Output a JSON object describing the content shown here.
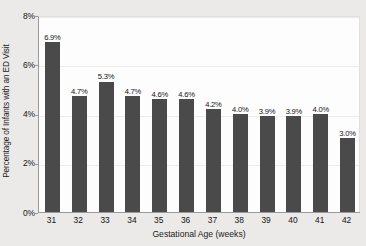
{
  "chart_data": {
    "type": "bar",
    "title": "",
    "xlabel": "Gestational Age (weeks)",
    "ylabel": "Percentage of Infants with an ED Visit",
    "categories": [
      "31",
      "32",
      "33",
      "34",
      "35",
      "36",
      "37",
      "38",
      "39",
      "40",
      "41",
      "42"
    ],
    "values": [
      6.9,
      4.7,
      5.3,
      4.7,
      4.6,
      4.6,
      4.2,
      4.0,
      3.9,
      3.9,
      4.0,
      3.0
    ],
    "data_labels": [
      "6.9%",
      "4.7%",
      "5.3%",
      "4.7%",
      "4.6%",
      "4.6%",
      "4.2%",
      "4.0%",
      "3.9%",
      "3.9%",
      "4.0%",
      "3.0%"
    ],
    "ylim": [
      0,
      8
    ],
    "ytick_values": [
      0,
      2,
      4,
      6,
      8
    ],
    "ytick_labels": [
      "0%",
      "2%",
      "4%",
      "6%",
      "8%"
    ],
    "grid": true,
    "grid_axis": "y",
    "legend": false,
    "bar_color": "#4a4a4a",
    "plot_background": "#fdfdfd",
    "figure_background": "#eceae8"
  }
}
